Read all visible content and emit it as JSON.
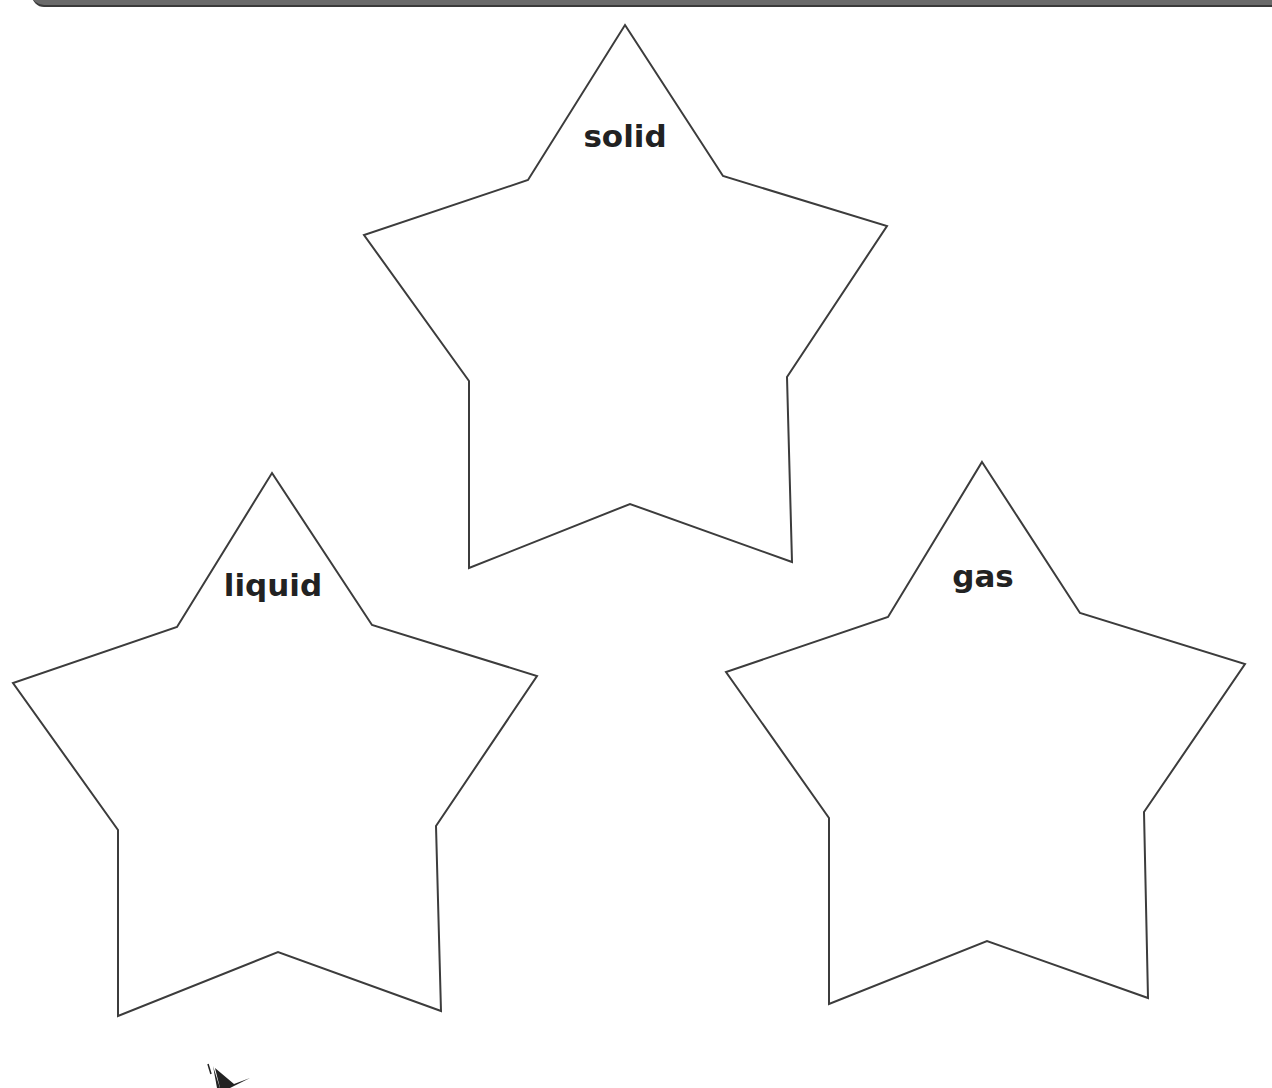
{
  "worksheet": {
    "stars": [
      {
        "label": "solid",
        "points": "625,25 723,176 887,226 787,377 792,562 630,504 469,568 469,381 364,235 528,180",
        "label_x": 625,
        "label_y": 118
      },
      {
        "label": "liquid",
        "points": "272,473 372,625 537,676 436,826 441,1011 278,952 118,1016 118,830 13,683 177,627",
        "label_x": 273,
        "label_y": 567
      },
      {
        "label": "gas",
        "points": "982,462 1080,613 1245,664 1144,812 1148,998 987,941 829,1004 829,818 726,672 888,617",
        "label_x": 983,
        "label_y": 558
      }
    ],
    "colors": {
      "outline": "#3c3c3c",
      "text": "#222222",
      "header_bar": "#6a6a6a"
    }
  }
}
